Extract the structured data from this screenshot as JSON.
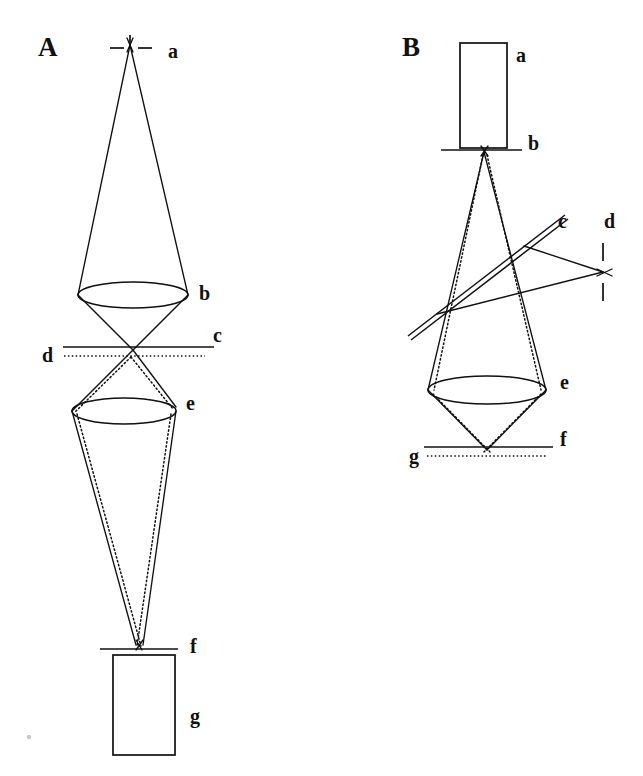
{
  "figure": {
    "kind": "optical-ray-diagram",
    "background_color": "#ffffff",
    "ink_color": "#101010",
    "width": 643,
    "height": 776,
    "panels": [
      {
        "id": "A",
        "letter": "A",
        "letter_pos": {
          "x": 38,
          "y": 56
        },
        "description": "Point source imaged through two lenses onto a detector",
        "labels": [
          {
            "key": "a",
            "text": "a",
            "x": 168,
            "y": 58,
            "refers_to": "point-source"
          },
          {
            "key": "b",
            "text": "b",
            "x": 199,
            "y": 300,
            "refers_to": "lens-b"
          },
          {
            "key": "c",
            "text": "c",
            "x": 213,
            "y": 342,
            "refers_to": "solid-focal-plane-c"
          },
          {
            "key": "d",
            "text": "d",
            "x": 42,
            "y": 362,
            "refers_to": "dotted-focal-plane-d"
          },
          {
            "key": "e",
            "text": "e",
            "x": 186,
            "y": 410,
            "refers_to": "lens-e"
          },
          {
            "key": "f",
            "text": "f",
            "x": 190,
            "y": 653,
            "refers_to": "image-plane-f"
          },
          {
            "key": "g",
            "text": "g",
            "x": 190,
            "y": 723,
            "refers_to": "detector-g"
          }
        ]
      },
      {
        "id": "B",
        "letter": "B",
        "letter_pos": {
          "x": 402,
          "y": 56
        },
        "description": "Source box with beam splitter deflecting rays to a side focus and a lens focusing onto two planes",
        "labels": [
          {
            "key": "a",
            "text": "a",
            "x": 516,
            "y": 62,
            "refers_to": "source-box-a"
          },
          {
            "key": "b",
            "text": "b",
            "x": 528,
            "y": 150,
            "refers_to": "aperture-plane-b"
          },
          {
            "key": "c",
            "text": "c",
            "x": 558,
            "y": 228,
            "refers_to": "beam-splitter-c"
          },
          {
            "key": "d",
            "text": "d",
            "x": 604,
            "y": 228,
            "refers_to": "side-focus-d"
          },
          {
            "key": "e",
            "text": "e",
            "x": 560,
            "y": 389,
            "refers_to": "lens-e"
          },
          {
            "key": "f",
            "text": "f",
            "x": 560,
            "y": 446,
            "refers_to": "solid-image-plane-f"
          },
          {
            "key": "g",
            "text": "g",
            "x": 412,
            "y": 461,
            "refers_to": "dotted-image-plane-g"
          }
        ]
      }
    ],
    "panel_a_geometry": {
      "source_point": {
        "x": 130,
        "y": 49
      },
      "source_tick_left": {
        "x1": 110,
        "y1": 48,
        "x2": 124,
        "y2": 48
      },
      "source_tick_right": {
        "x1": 138,
        "y1": 48,
        "x2": 152,
        "y2": 48
      },
      "source_tick_vertical": {
        "x1": 130,
        "y1": 36,
        "x2": 130,
        "y2": 46
      },
      "lens_b": {
        "cx": 133,
        "cy": 295,
        "rx": 55,
        "ry": 13
      },
      "plane_c": {
        "x1": 63,
        "y1": 347,
        "x2": 214,
        "y2": 347
      },
      "plane_d": {
        "x1": 64,
        "y1": 356,
        "x2": 205,
        "y2": 356
      },
      "crossover_point": {
        "x": 133,
        "y": 350
      },
      "lens_e": {
        "cx": 124,
        "cy": 411,
        "rx": 52,
        "ry": 13
      },
      "image_point": {
        "x": 139,
        "y": 645
      },
      "plane_f": {
        "x1": 100,
        "y1": 649,
        "x2": 178,
        "y2": 649
      },
      "detector_g": {
        "x": 113,
        "y": 655,
        "width": 62,
        "height": 100
      }
    },
    "panel_b_geometry": {
      "source_box_a": {
        "x": 460,
        "y": 43,
        "width": 47,
        "height": 105
      },
      "plane_b": {
        "x1": 441,
        "y1": 150,
        "x2": 522,
        "y2": 150
      },
      "aperture_point": {
        "x": 484,
        "y": 150
      },
      "beam_splitter_c": {
        "x1": 408,
        "y1": 333,
        "x2": 565,
        "y2": 214
      },
      "splitter_gap": 3,
      "side_focus_d": {
        "x": 603,
        "y": 272
      },
      "focus_tick_upper": {
        "x1": 603,
        "y1": 244,
        "x2": 603,
        "y2": 262
      },
      "focus_tick_lower": {
        "x1": 603,
        "y1": 282,
        "x2": 603,
        "y2": 300
      },
      "lens_e": {
        "cx": 487,
        "cy": 390,
        "rx": 59,
        "ry": 14
      },
      "plane_f": {
        "x1": 424,
        "y1": 447,
        "x2": 553,
        "y2": 447
      },
      "plane_g": {
        "x1": 427,
        "y1": 456,
        "x2": 547,
        "y2": 456
      },
      "image_point": {
        "x": 487,
        "y": 450
      }
    },
    "legend_note": "Solid lines and dotted lines represent two distinct ray bundles (e.g. two wavelengths or object points)"
  }
}
